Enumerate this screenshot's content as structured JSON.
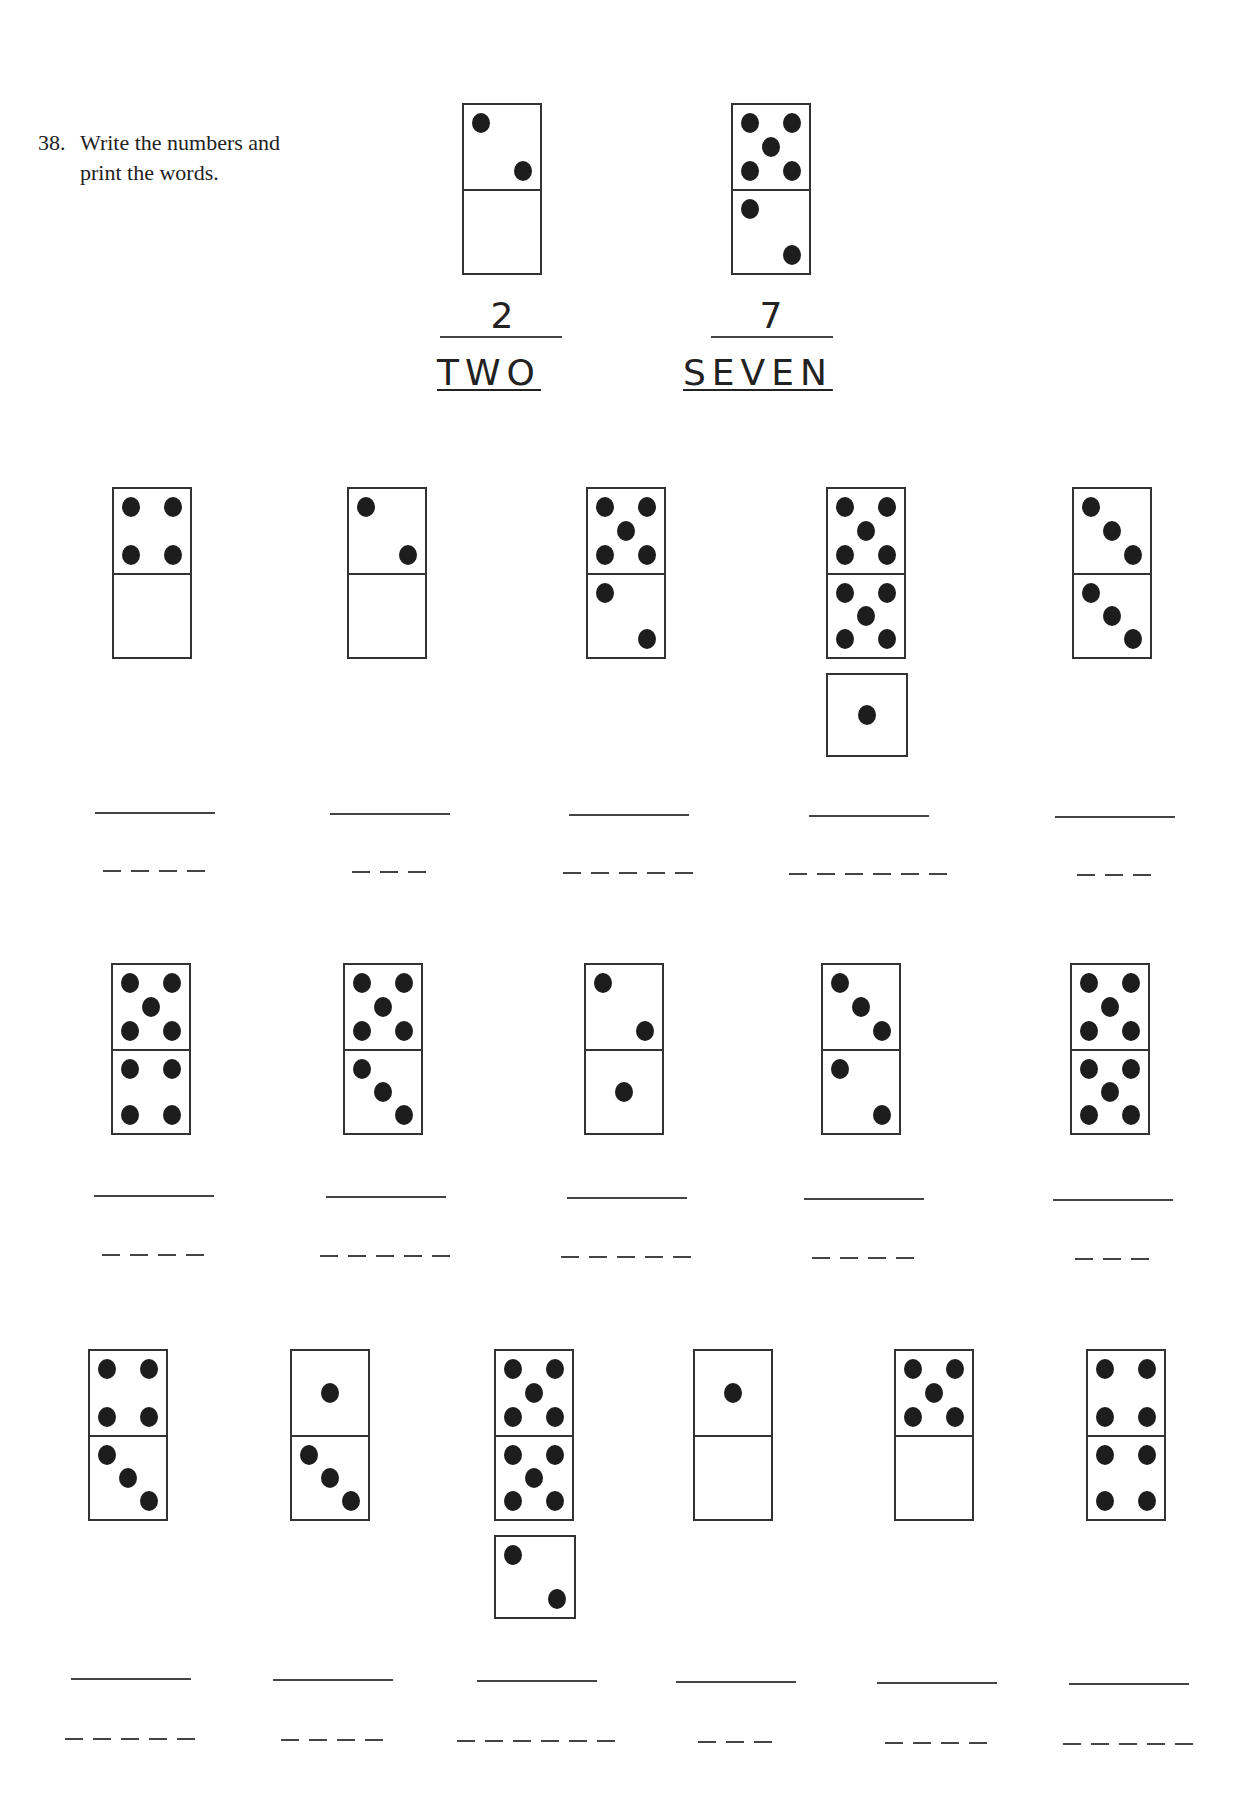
{
  "exercise": {
    "number": "38.",
    "instruction_line1": "Write the numbers and",
    "instruction_line2": "print the words."
  },
  "examples": [
    {
      "number": "2",
      "word": "TWO",
      "halves": [
        2,
        0
      ]
    },
    {
      "number": "7",
      "word": "SEVEN",
      "halves": [
        5,
        2
      ]
    }
  ],
  "rows": [
    {
      "items": [
        {
          "halves": [
            4,
            0
          ],
          "answer": "4",
          "word_letters": 4
        },
        {
          "halves": [
            2,
            0
          ],
          "answer": "2",
          "word_letters": 3
        },
        {
          "halves": [
            5,
            2
          ],
          "answer": "7",
          "word_letters": 5
        },
        {
          "halves": [
            5,
            5,
            1
          ],
          "answer": "11",
          "word_letters": 6
        },
        {
          "halves": [
            3,
            3
          ],
          "answer": "6",
          "word_letters": 3
        }
      ]
    },
    {
      "items": [
        {
          "halves": [
            5,
            4
          ],
          "answer": "9",
          "word_letters": 4
        },
        {
          "halves": [
            5,
            3
          ],
          "answer": "8",
          "word_letters": 5
        },
        {
          "halves": [
            2,
            1
          ],
          "answer": "3",
          "word_letters": 5
        },
        {
          "halves": [
            3,
            2
          ],
          "answer": "5",
          "word_letters": 4
        },
        {
          "halves": [
            5,
            5
          ],
          "answer": "10",
          "word_letters": 3
        }
      ]
    },
    {
      "items": [
        {
          "halves": [
            4,
            3
          ],
          "answer": "7",
          "word_letters": 5
        },
        {
          "halves": [
            1,
            3
          ],
          "answer": "4",
          "word_letters": 4
        },
        {
          "halves": [
            5,
            5,
            2
          ],
          "answer": "12",
          "word_letters": 6
        },
        {
          "halves": [
            1,
            0
          ],
          "answer": "1",
          "word_letters": 3
        },
        {
          "halves": [
            5,
            0
          ],
          "answer": "5",
          "word_letters": 4
        },
        {
          "halves": [
            4,
            4
          ],
          "answer": "8",
          "word_letters": 5
        }
      ]
    }
  ]
}
